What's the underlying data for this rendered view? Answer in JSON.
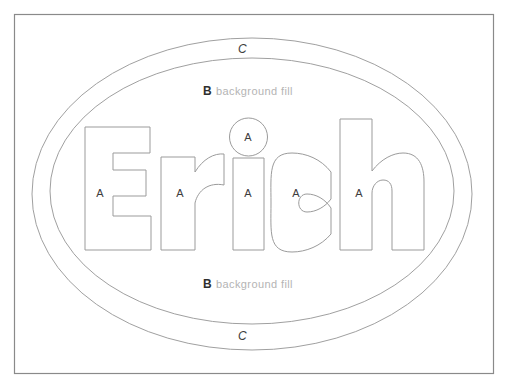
{
  "canvas": {
    "width": 512,
    "height": 390,
    "background_color": "#ffffff",
    "title": "Erich layered outline diagram"
  },
  "frame": {
    "name": "outer-rectangle-frame",
    "stroke_color": "#8a8a8a",
    "x": 14,
    "y": 14,
    "width": 480,
    "height": 360
  },
  "ellipses": {
    "outer": {
      "label": "C",
      "name": "outer-ellipse",
      "stroke_color": "#a0a0a0",
      "cx": 252,
      "cy": 194,
      "rx": 220,
      "ry": 156
    },
    "inner": {
      "label": "B",
      "label_suffix": "background fill",
      "name": "inner-ellipse",
      "stroke_color": "#a0a0a0",
      "cx": 252,
      "cy": 191,
      "rx": 202,
      "ry": 133
    }
  },
  "labels": {
    "c_top": "C",
    "c_bottom": "C",
    "b_top_letter": "B",
    "b_top_text": "background fill",
    "b_bottom_letter": "B",
    "b_bottom_text": "background fill",
    "a_letters": [
      {
        "id": "a-on-E",
        "text": "A",
        "x": 100,
        "y": 197
      },
      {
        "id": "a-on-r",
        "text": "A",
        "x": 180,
        "y": 197
      },
      {
        "id": "a-on-i-dot",
        "text": "A",
        "x": 248,
        "y": 141
      },
      {
        "id": "a-on-i-stem",
        "text": "A",
        "x": 248,
        "y": 197
      },
      {
        "id": "a-on-c",
        "text": "A",
        "x": 296,
        "y": 197
      },
      {
        "id": "a-on-h",
        "text": "A",
        "x": 359,
        "y": 197
      }
    ]
  },
  "word": {
    "text": "Erich",
    "glyphs": [
      {
        "id": "glyph-E",
        "char": "E"
      },
      {
        "id": "glyph-r",
        "char": "r"
      },
      {
        "id": "glyph-i",
        "char": "i"
      },
      {
        "id": "glyph-c",
        "char": "c"
      },
      {
        "id": "glyph-h",
        "char": "h"
      }
    ],
    "stroke_color": "#9b9b9b",
    "fill": "none"
  },
  "legend": {
    "a_meaning": "A",
    "b_meaning": "B",
    "c_meaning": "C"
  }
}
